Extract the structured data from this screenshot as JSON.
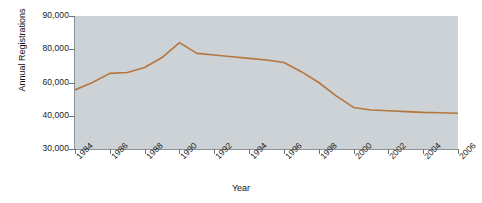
{
  "chart_data": {
    "type": "line",
    "title": "",
    "xlabel": "Year",
    "ylabel": "Annual Registrations",
    "grid": false,
    "legend": "none",
    "line_color": "#b5763f",
    "plot_background": "#ccd2d6",
    "y_tick_labels": [
      "90,000",
      "80,000",
      "60,000",
      "40,000",
      "30,000"
    ],
    "y_tick_values": [
      90000,
      80000,
      60000,
      40000,
      30000
    ],
    "y_axis_note": "tick labels are evenly spaced on the axis although their numeric intervals are unequal",
    "ylim": [
      30000,
      90000
    ],
    "xlim": [
      1984,
      2006
    ],
    "x_tick_labels": [
      "1984",
      "1986",
      "1988",
      "1990",
      "1992",
      "1994",
      "1996",
      "1998",
      "2000",
      "2002",
      "2004",
      "2006"
    ],
    "x_tick_values": [
      1984,
      1986,
      1988,
      1990,
      1992,
      1994,
      1996,
      1998,
      2000,
      2002,
      2004,
      2006
    ],
    "x": [
      1984,
      1985,
      1986,
      1987,
      1988,
      1989,
      1990,
      1991,
      1992,
      1993,
      1994,
      1995,
      1996,
      1997,
      1998,
      1999,
      2000,
      2001,
      2002,
      2003,
      2004,
      2005,
      2006
    ],
    "values": [
      55500,
      60000,
      65500,
      66000,
      69000,
      75000,
      82000,
      77500,
      76500,
      75500,
      74500,
      73500,
      72000,
      66500,
      60000,
      52000,
      45000,
      43500,
      43000,
      42500,
      42000,
      41800,
      41500
    ],
    "series": [
      {
        "name": "Annual Registrations",
        "color": "#b5763f",
        "values": [
          55500,
          60000,
          65500,
          66000,
          69000,
          75000,
          82000,
          77500,
          76500,
          75500,
          74500,
          73500,
          72000,
          66500,
          60000,
          52000,
          45000,
          43500,
          43000,
          42500,
          42000,
          41800,
          41500
        ]
      }
    ]
  }
}
